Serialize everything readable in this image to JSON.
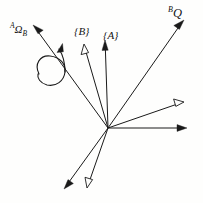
{
  "figure": {
    "background_color": "#fefefd",
    "ink_color": "#1a1a1a",
    "width": 203,
    "height": 203,
    "origin": {
      "x": 108,
      "y": 128
    }
  },
  "labels": {
    "angular_velocity": {
      "superscript": "A",
      "symbol": "Ω",
      "subscript": "B",
      "full_text": "AΩB",
      "x": 10,
      "y": 22
    },
    "frame_b": {
      "text": "{B}",
      "x": 74,
      "y": 26
    },
    "frame_a": {
      "text": "{A}",
      "x": 103,
      "y": 30
    },
    "vector_q": {
      "superscript": "B",
      "symbol": "Q",
      "full_text": "BQ",
      "x": 168,
      "y": 6
    }
  },
  "vectors": [
    {
      "name": "angular-velocity-axis",
      "label": "AΩB",
      "from": {
        "x": 108,
        "y": 128
      },
      "to": {
        "x": 34,
        "y": 26
      },
      "head": "solid",
      "stroke_width": 1.0
    },
    {
      "name": "frame-b-axis",
      "label": "{B}",
      "from": {
        "x": 108,
        "y": 128
      },
      "to": {
        "x": 84,
        "y": 46
      },
      "head": "hollow",
      "stroke_width": 1.0
    },
    {
      "name": "frame-a-axis",
      "label": "{A}",
      "from": {
        "x": 108,
        "y": 128
      },
      "to": {
        "x": 105,
        "y": 40
      },
      "head": "solid",
      "stroke_width": 1.0
    },
    {
      "name": "vector-q",
      "label": "BQ",
      "from": {
        "x": 108,
        "y": 128
      },
      "to": {
        "x": 184,
        "y": 20
      },
      "head": "solid",
      "stroke_width": 1.0
    },
    {
      "name": "upper-right-axis",
      "label": "",
      "from": {
        "x": 108,
        "y": 128
      },
      "to": {
        "x": 184,
        "y": 102
      },
      "head": "hollow",
      "stroke_width": 1.0
    },
    {
      "name": "horizontal-axis",
      "label": "",
      "from": {
        "x": 108,
        "y": 128
      },
      "to": {
        "x": 187,
        "y": 128
      },
      "head": "solid",
      "stroke_width": 1.0
    },
    {
      "name": "lower-left-axis",
      "label": "",
      "from": {
        "x": 108,
        "y": 128
      },
      "to": {
        "x": 64,
        "y": 189
      },
      "head": "solid",
      "stroke_width": 1.0
    },
    {
      "name": "lower-middle-axis",
      "label": "",
      "from": {
        "x": 108,
        "y": 128
      },
      "to": {
        "x": 87,
        "y": 188
      },
      "head": "hollow",
      "stroke_width": 1.0
    }
  ],
  "rotation_arc": {
    "name": "rotation-arc",
    "description": "curved arrow indicating rotation sense about the angular velocity axis",
    "head": "solid",
    "stroke_width": 1.1
  }
}
